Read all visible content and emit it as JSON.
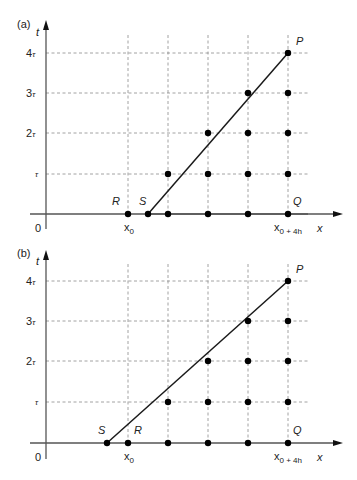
{
  "figure": {
    "panels": [
      {
        "id": "a",
        "panel_label": "(a)",
        "t_axis_label": "t",
        "x_axis_label": "x",
        "origin_label": "0",
        "t_ticks": [
          "τ",
          "2τ",
          "3τ",
          "4τ"
        ],
        "x_tick_start": "x0",
        "x_tick_end": "x0 + 4h",
        "points": {
          "P": "P",
          "Q": "Q",
          "R": "R",
          "S": "S"
        },
        "characteristic": "S lies between x0 and x0+h; line S→P passes through grid",
        "grid_nodes": [
          [
            0,
            0
          ],
          [
            1,
            0
          ],
          [
            2,
            0
          ],
          [
            3,
            0
          ],
          [
            4,
            0
          ],
          [
            1,
            1
          ],
          [
            2,
            1
          ],
          [
            3,
            1
          ],
          [
            4,
            1
          ],
          [
            2,
            2
          ],
          [
            3,
            2
          ],
          [
            4,
            2
          ],
          [
            3,
            3
          ],
          [
            4,
            3
          ],
          [
            4,
            4
          ]
        ],
        "S_position_h": 0.5
      },
      {
        "id": "b",
        "panel_label": "(b)",
        "t_axis_label": "t",
        "x_axis_label": "x",
        "origin_label": "0",
        "t_ticks": [
          "τ",
          "2τ",
          "3τ",
          "4τ"
        ],
        "x_tick_start": "x0",
        "x_tick_end": "x0 + 4h",
        "points": {
          "P": "P",
          "Q": "Q",
          "R": "R",
          "S": "S"
        },
        "characteristic": "S lies to the left of x0; line S→P",
        "grid_nodes": [
          [
            0,
            0
          ],
          [
            1,
            0
          ],
          [
            2,
            0
          ],
          [
            3,
            0
          ],
          [
            4,
            0
          ],
          [
            1,
            1
          ],
          [
            2,
            1
          ],
          [
            3,
            1
          ],
          [
            4,
            1
          ],
          [
            2,
            2
          ],
          [
            3,
            2
          ],
          [
            4,
            2
          ],
          [
            3,
            3
          ],
          [
            4,
            3
          ],
          [
            4,
            4
          ]
        ],
        "S_position_h": -0.5
      }
    ]
  },
  "labels": {
    "a_panel": "(a)",
    "b_panel": "(b)",
    "t": "t",
    "x": "x",
    "zero": "0",
    "tau": "τ",
    "two_tau": "2",
    "three_tau": "3",
    "four_tau": "4",
    "tau_sym": "τ",
    "x0_base": "x",
    "x0_sub": "0",
    "x4h_base": "x",
    "x4h_sub": "0 + 4h",
    "P": "P",
    "Q": "Q",
    "R": "R",
    "S": "S"
  }
}
